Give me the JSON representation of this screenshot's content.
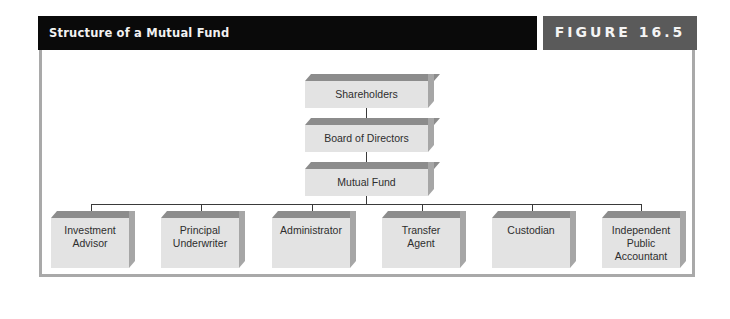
{
  "header": {
    "title": "Structure of a Mutual Fund",
    "figure_label": "FIGURE 16.5"
  },
  "colors": {
    "title_bar": "#0a0a0a",
    "figure_bar": "#5a5a5a",
    "frame_border": "#a9a9a9",
    "box_face": "#e3e3e3",
    "box_top": "#8c8c8c",
    "box_side": "#a6a6a6",
    "connector": "#3a3a3a"
  },
  "diagram": {
    "hierarchy": [
      {
        "id": "shareholders",
        "label": "Shareholders"
      },
      {
        "id": "board",
        "label": "Board of Directors"
      },
      {
        "id": "fund",
        "label": "Mutual Fund"
      }
    ],
    "service_providers": [
      {
        "id": "advisor",
        "label": "Investment Advisor",
        "lines": [
          "Investment",
          "Advisor"
        ]
      },
      {
        "id": "underwriter",
        "label": "Principal Underwriter",
        "lines": [
          "Principal",
          "Underwriter"
        ]
      },
      {
        "id": "administrator",
        "label": "Administrator",
        "lines": [
          "Administrator"
        ]
      },
      {
        "id": "transfer",
        "label": "Transfer Agent",
        "lines": [
          "Transfer",
          "Agent"
        ]
      },
      {
        "id": "custodian",
        "label": "Custodian",
        "lines": [
          "Custodian"
        ]
      },
      {
        "id": "accountant",
        "label": "Independent Public Accountant",
        "lines": [
          "Independent",
          "Public",
          "Accountant"
        ]
      }
    ],
    "edges": [
      [
        "shareholders",
        "board"
      ],
      [
        "board",
        "fund"
      ],
      [
        "fund",
        "advisor"
      ],
      [
        "fund",
        "underwriter"
      ],
      [
        "fund",
        "administrator"
      ],
      [
        "fund",
        "transfer"
      ],
      [
        "fund",
        "custodian"
      ],
      [
        "fund",
        "accountant"
      ]
    ]
  }
}
